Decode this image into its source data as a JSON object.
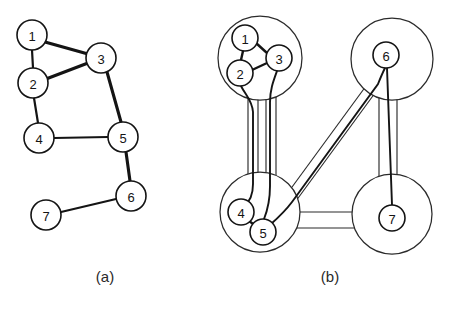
{
  "figure": {
    "background_color": "#ffffff",
    "line_color": "#141414",
    "cluster_outline_color": "#2b2b2b"
  },
  "panels": [
    {
      "id": "panel-a",
      "caption": "(a)",
      "caption_x": 105,
      "caption_y": 270,
      "description": "original graph"
    },
    {
      "id": "panel-b",
      "caption": "(b)",
      "caption_x": 330,
      "caption_y": 270,
      "description": "clustered graph"
    }
  ],
  "graph_a": {
    "nodes": [
      {
        "id": "1",
        "label": "1",
        "x": 32,
        "y": 35,
        "r": 15
      },
      {
        "id": "2",
        "label": "2",
        "x": 33,
        "y": 83,
        "r": 15
      },
      {
        "id": "3",
        "label": "3",
        "x": 101,
        "y": 58,
        "r": 15
      },
      {
        "id": "4",
        "label": "4",
        "x": 39,
        "y": 138,
        "r": 15
      },
      {
        "id": "5",
        "label": "5",
        "x": 123,
        "y": 137,
        "r": 15
      },
      {
        "id": "6",
        "label": "6",
        "x": 131,
        "y": 196,
        "r": 15
      },
      {
        "id": "7",
        "label": "7",
        "x": 46,
        "y": 215,
        "r": 15
      }
    ],
    "edges": [
      {
        "from": "1",
        "to": "3",
        "weight": "thick"
      },
      {
        "from": "1",
        "to": "2",
        "weight": "thin"
      },
      {
        "from": "2",
        "to": "3",
        "weight": "thick"
      },
      {
        "from": "2",
        "to": "4",
        "weight": "thin"
      },
      {
        "from": "3",
        "to": "5",
        "weight": "thick"
      },
      {
        "from": "4",
        "to": "5",
        "weight": "thin"
      },
      {
        "from": "5",
        "to": "6",
        "weight": "thick"
      },
      {
        "from": "6",
        "to": "7",
        "weight": "thin"
      }
    ]
  },
  "graph_b": {
    "clusters": [
      {
        "id": "cluster-top-left",
        "cx": 260,
        "cy": 58,
        "r": 42,
        "members": [
          "1",
          "2",
          "3"
        ]
      },
      {
        "id": "cluster-top-right",
        "cx": 392,
        "cy": 59,
        "r": 41,
        "members": [
          "6"
        ]
      },
      {
        "id": "cluster-bottom-left",
        "cx": 260,
        "cy": 212,
        "r": 40,
        "members": [
          "4",
          "5"
        ]
      },
      {
        "id": "cluster-bottom-right",
        "cx": 392,
        "cy": 214,
        "r": 40,
        "members": [
          "7"
        ]
      }
    ],
    "nodes": [
      {
        "id": "1",
        "label": "1",
        "x": 245,
        "y": 38,
        "r": 13
      },
      {
        "id": "2",
        "label": "2",
        "x": 240,
        "y": 73,
        "r": 13
      },
      {
        "id": "3",
        "label": "3",
        "x": 279,
        "y": 58,
        "r": 13
      },
      {
        "id": "4",
        "label": "4",
        "x": 241,
        "y": 212,
        "r": 13
      },
      {
        "id": "5",
        "label": "5",
        "x": 263,
        "y": 232,
        "r": 13
      },
      {
        "id": "6",
        "label": "6",
        "x": 386,
        "y": 55,
        "r": 13
      },
      {
        "id": "7",
        "label": "7",
        "x": 392,
        "y": 218,
        "r": 13
      }
    ],
    "intra_edges": [
      {
        "from": "1",
        "to": "2"
      },
      {
        "from": "1",
        "to": "3"
      },
      {
        "from": "2",
        "to": "3"
      },
      {
        "from": "4",
        "to": "5"
      }
    ],
    "tubes": [
      {
        "id": "tube-topleft-bottomleft",
        "from": "cluster-top-left",
        "to": "cluster-bottom-left",
        "bundled_edges": [
          "2-4",
          "3-5"
        ]
      },
      {
        "id": "tube-bottomleft-topright",
        "from": "cluster-bottom-left",
        "to": "cluster-top-right",
        "bundled_edges": [
          "5-6"
        ]
      },
      {
        "id": "tube-topright-bottomright",
        "from": "cluster-top-right",
        "to": "cluster-bottom-right",
        "bundled_edges": [
          "6-7"
        ]
      },
      {
        "id": "tube-bottomleft-bottomright",
        "from": "cluster-bottom-left",
        "to": "cluster-bottom-right",
        "bundled_edges": []
      }
    ]
  }
}
